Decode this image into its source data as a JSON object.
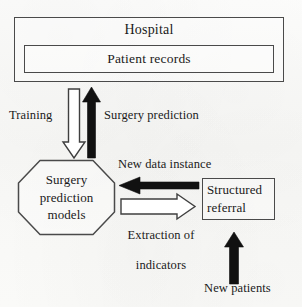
{
  "diagram": {
    "background_color": "#fbfbfa",
    "stroke_color": "#4a4a4a",
    "fill_arrow_color": "#111111",
    "hollow_arrow_fill": "#ffffff",
    "nodes": {
      "hospital": {
        "label": "Hospital",
        "shape": "rectangle"
      },
      "patient_records": {
        "label": "Patient records",
        "shape": "rectangle"
      },
      "surgery_models": {
        "label": "Surgery\nprediction\nmodels",
        "line1": "Surgery",
        "line2": "prediction",
        "line3": "models",
        "shape": "octagon"
      },
      "structured_referral": {
        "label": "Structured\nreferral",
        "line1": "Structured",
        "line2": "referral",
        "shape": "rectangle"
      }
    },
    "edges": [
      {
        "id": "training",
        "label": "Training",
        "direction": "down",
        "style": "hollow",
        "from": "patient_records",
        "to": "surgery_models"
      },
      {
        "id": "surgery-prediction",
        "label": "Surgery prediction",
        "direction": "up",
        "style": "filled",
        "from": "surgery_models",
        "to": "patient_records"
      },
      {
        "id": "new-data-instance",
        "label": "New data instance",
        "direction": "left",
        "style": "filled",
        "from": "structured_referral",
        "to": "surgery_models"
      },
      {
        "id": "extraction-of-indicators",
        "label": "Extraction of\nindicators",
        "line1": "Extraction of",
        "line2": "indicators",
        "direction": "right",
        "style": "hollow",
        "from": "surgery_models",
        "to": "structured_referral"
      },
      {
        "id": "new-patients",
        "label": "New patients",
        "direction": "up",
        "style": "filled",
        "from": "new_patients_source",
        "to": "structured_referral"
      }
    ]
  }
}
